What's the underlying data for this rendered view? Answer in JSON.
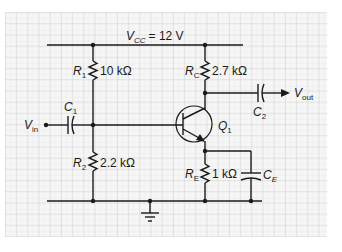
{
  "colors": {
    "background": "#ffffff",
    "grid_paper": "#f4f4f4",
    "grid_minor": "#e2e2e2",
    "grid_major": "#c9c9c9",
    "wire": "#1a1a1a"
  },
  "supply": {
    "label_main": "V",
    "label_sub": "CC",
    "value": "= 12 V"
  },
  "components": {
    "R1": {
      "name_main": "R",
      "name_sub": "1",
      "value": "10 kΩ"
    },
    "R2": {
      "name_main": "R",
      "name_sub": "2",
      "value": "2.2 kΩ"
    },
    "RC": {
      "name_main": "R",
      "name_sub": "C",
      "value": "2.7 kΩ"
    },
    "RE": {
      "name_main": "R",
      "name_sub": "E",
      "value": "1 kΩ"
    },
    "C1": {
      "name_main": "C",
      "name_sub": "1"
    },
    "C2": {
      "name_main": "C",
      "name_sub": "2"
    },
    "CE": {
      "name_main": "C",
      "name_sub": "E"
    },
    "Q1": {
      "name_main": "Q",
      "name_sub": "1",
      "type": "npn-transistor"
    }
  },
  "ports": {
    "input": {
      "label_main": "V",
      "label_sub": "in"
    },
    "output": {
      "label_main": "V",
      "label_sub": "out"
    }
  },
  "ground": {
    "symbol": "ground-icon"
  }
}
